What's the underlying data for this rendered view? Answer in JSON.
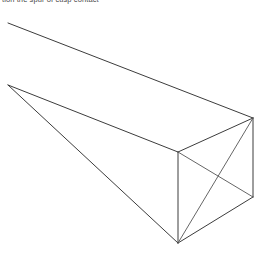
{
  "caption": {
    "text": "tion the spur of cusp contact"
  },
  "figure": {
    "background_color": "#ffffff",
    "line_color": "#3c3c3c",
    "line_width": 1,
    "canvas": {
      "width": 262,
      "height": 264
    },
    "vertices": {
      "far_top_left": {
        "x": 8,
        "y": 23
      },
      "far_mid_left": {
        "x": 8,
        "y": 85
      },
      "near_top_right": {
        "x": 253,
        "y": 118
      },
      "near_apex_left": {
        "x": 178,
        "y": 152
      },
      "near_bottom_right": {
        "x": 253,
        "y": 197
      },
      "near_bottom": {
        "x": 178,
        "y": 243
      }
    },
    "edges": [
      {
        "name": "top-receding-edge",
        "from": "far_top_left",
        "to": "near_top_right"
      },
      {
        "name": "middle-receding-edge",
        "from": "far_mid_left",
        "to": "near_apex_left"
      },
      {
        "name": "lower-receding-edge",
        "from": "far_mid_left",
        "to": "near_bottom"
      },
      {
        "name": "end-face-upper-left",
        "from": "near_apex_left",
        "to": "near_top_right"
      },
      {
        "name": "end-face-right-vertical",
        "from": "near_top_right",
        "to": "near_bottom_right"
      },
      {
        "name": "end-face-lower-right",
        "from": "near_bottom_right",
        "to": "near_bottom"
      },
      {
        "name": "end-face-left-vertical",
        "from": "near_apex_left",
        "to": "near_bottom"
      },
      {
        "name": "end-face-diagonal-a",
        "from": "near_top_right",
        "to": "near_bottom"
      },
      {
        "name": "end-face-diagonal-b",
        "from": "near_apex_left",
        "to": "near_bottom_right"
      }
    ]
  }
}
